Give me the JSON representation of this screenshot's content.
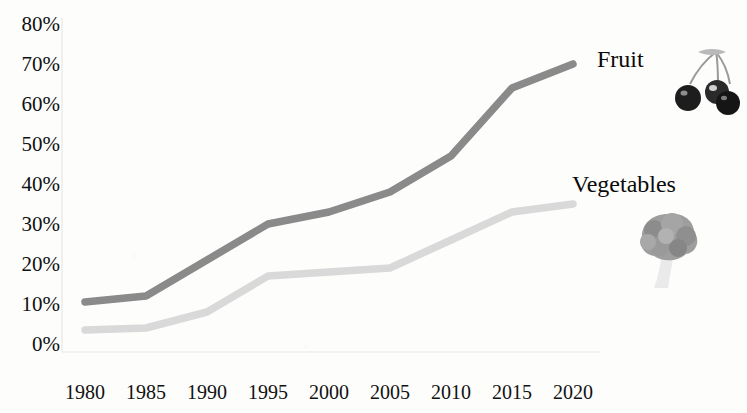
{
  "chart_data": {
    "type": "line",
    "title": "",
    "subtitle": "",
    "xlabel": "",
    "ylabel": "",
    "x": [
      1980,
      1985,
      1990,
      1995,
      2000,
      2005,
      2010,
      2015,
      2020
    ],
    "x_tick_labels": [
      "1980",
      "1985",
      "1990",
      "1995",
      "2000",
      "2005",
      "2010",
      "2015",
      "2020"
    ],
    "y_tick_labels": [
      "0%",
      "10%",
      "20%",
      "30%",
      "40%",
      "50%",
      "60%",
      "70%",
      "80%"
    ],
    "y_tick_values": [
      0,
      10,
      20,
      30,
      40,
      50,
      60,
      70,
      80
    ],
    "ylim": [
      0,
      80
    ],
    "xlim": [
      1980,
      2020
    ],
    "grid": false,
    "legend_position": "inline-right",
    "series": [
      {
        "name": "Fruit",
        "color": "#8a8a8a",
        "values": [
          10.5,
          12,
          21,
          30,
          33,
          38,
          47,
          64,
          70
        ]
      },
      {
        "name": "Vegetables",
        "color": "#d9d9d9",
        "values": [
          3.5,
          4,
          8,
          17,
          18,
          19,
          26,
          33,
          35
        ]
      }
    ],
    "annotations": [
      {
        "name": "fruit-icon",
        "label": "cherries"
      },
      {
        "name": "vegetables-icon",
        "label": "broccoli"
      }
    ]
  },
  "labels": {
    "fruit": "Fruit",
    "vegetables": "Vegetables"
  },
  "colors": {
    "fruit_line": "#8a8a8a",
    "vegetables_line": "#d9d9d9",
    "background": "#fdfdfc",
    "text": "#111111"
  }
}
